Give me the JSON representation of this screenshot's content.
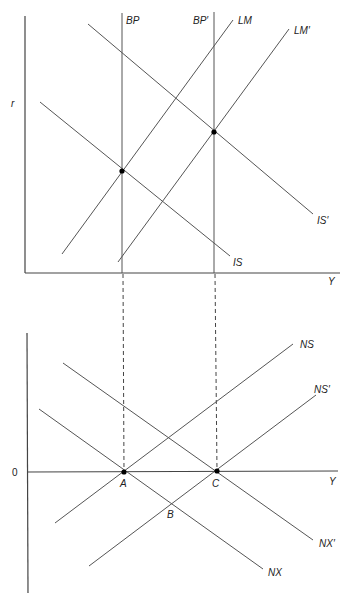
{
  "top_panel": {
    "y_axis_label": "r",
    "x_axis_label": "Y",
    "curves": {
      "BP": "BP",
      "BP_prime": "BP′",
      "LM": "LM",
      "LM_prime": "LM′",
      "IS": "IS",
      "IS_prime": "IS′"
    }
  },
  "bottom_panel": {
    "y_axis_label": "0",
    "x_axis_label": "Y",
    "curves": {
      "NS": "NS",
      "NS_prime": "NS′",
      "NX": "NX",
      "NX_prime": "NX′"
    },
    "points": {
      "A": "A",
      "B": "B",
      "C": "C"
    }
  },
  "colors": {
    "line": "#555555",
    "axis": "#444444",
    "point": "#000000"
  }
}
